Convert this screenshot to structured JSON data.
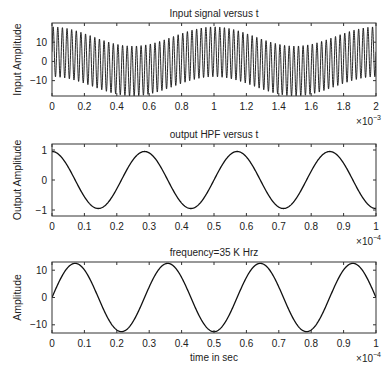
{
  "figure": {
    "background": "#ffffff",
    "line_color": "#111111",
    "axis_color": "#333333"
  },
  "chart_data": [
    {
      "type": "line",
      "title": "Input signal versus t",
      "xlabel": "",
      "ylabel": "Input Amplitude",
      "x_exponent_base": "×10",
      "x_exponent": "−3",
      "xlim": [
        0,
        2
      ],
      "ylim": [
        -18,
        20
      ],
      "xticks": [
        0,
        0.2,
        0.4,
        0.6,
        0.8,
        1,
        1.2,
        1.4,
        1.6,
        1.8,
        2
      ],
      "xtick_labels": [
        "0",
        "0.2",
        "0.4",
        "0.6",
        "0.8",
        "1",
        "1.2",
        "1.4",
        "1.6",
        "1.8",
        "2"
      ],
      "yticks": [
        -10,
        0,
        10
      ],
      "ytick_labels": [
        "−10",
        "0",
        "10"
      ],
      "grid": false,
      "description": "Sum of a 1 kHz low-frequency cosine (amplitude ~5) and a 35 kHz sine (amplitude ~13); envelope max ~18 at t=0,1,2 (×1e-3), ~8 at t=0.5,1.5",
      "components": [
        {
          "kind": "cos",
          "amplitude": 5,
          "cycles_per_unit": 1
        },
        {
          "kind": "sin",
          "amplitude": 13,
          "cycles_per_unit": 35
        }
      ],
      "series": [
        {
          "name": "input",
          "envelope_upper": [
            [
              0,
              18
            ],
            [
              0.5,
              8
            ],
            [
              1,
              18
            ],
            [
              1.5,
              8
            ],
            [
              2,
              18
            ]
          ],
          "envelope_lower": [
            [
              0,
              -8
            ],
            [
              0.5,
              -18
            ],
            [
              1,
              -8
            ],
            [
              1.5,
              -18
            ],
            [
              2,
              -8
            ]
          ]
        }
      ]
    },
    {
      "type": "line",
      "title": "output HPF versus t",
      "xlabel": "",
      "ylabel": "Output Amplitude",
      "x_exponent_base": "×10",
      "x_exponent": "−4",
      "xlim": [
        0,
        1
      ],
      "ylim": [
        -1.2,
        1.2
      ],
      "xticks": [
        0,
        0.1,
        0.2,
        0.3,
        0.4,
        0.5,
        0.6,
        0.7,
        0.8,
        0.9,
        1
      ],
      "xtick_labels": [
        "0",
        "0.1",
        "0.2",
        "0.3",
        "0.4",
        "0.5",
        "0.6",
        "0.7",
        "0.8",
        "0.9",
        "1"
      ],
      "yticks": [
        -1,
        0,
        1
      ],
      "ytick_labels": [
        "−1",
        "0",
        "1"
      ],
      "grid": false,
      "components": [
        {
          "kind": "cos",
          "amplitude": 0.95,
          "cycles_per_unit": 3.5
        }
      ],
      "series": [
        {
          "name": "output HPF",
          "x": [
            0,
            0.143,
            0.286,
            0.429,
            0.571,
            0.714,
            0.857,
            1.0
          ],
          "y": [
            0.95,
            -0.95,
            0.95,
            -0.95,
            0.95,
            -0.95,
            0.95,
            -0.95
          ]
        }
      ]
    },
    {
      "type": "line",
      "title": "frequency=35 K Hrz",
      "xlabel": "time in sec",
      "ylabel": "Amplitude",
      "x_exponent_base": "×10",
      "x_exponent": "−4",
      "xlim": [
        0,
        1
      ],
      "ylim": [
        -13,
        13
      ],
      "xticks": [
        0,
        0.1,
        0.2,
        0.3,
        0.4,
        0.5,
        0.6,
        0.7,
        0.8,
        0.9,
        1
      ],
      "xtick_labels": [
        "0",
        "0.1",
        "0.2",
        "0.3",
        "0.4",
        "0.5",
        "0.6",
        "0.7",
        "0.8",
        "0.9",
        "1"
      ],
      "yticks": [
        -10,
        0,
        10
      ],
      "ytick_labels": [
        "−10",
        "0",
        "10"
      ],
      "grid": false,
      "components": [
        {
          "kind": "sin",
          "amplitude": 12.5,
          "cycles_per_unit": 3.5
        }
      ],
      "series": [
        {
          "name": "35 kHz sine",
          "x": [
            0,
            0.071,
            0.214,
            0.357,
            0.5,
            0.643,
            0.786,
            0.929,
            1.0
          ],
          "y": [
            0,
            12.5,
            -12.5,
            12.5,
            -12.5,
            12.5,
            -12.5,
            12.5,
            0
          ]
        }
      ]
    }
  ]
}
